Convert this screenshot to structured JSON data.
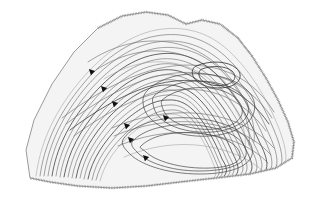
{
  "figure": {
    "domain": "map",
    "kind": "structural-contour-map",
    "title": "",
    "width": 310,
    "height": 201,
    "background_color": "#ffffff",
    "interior_fill_color": "#f4f4f4",
    "contour_color": "#6d6d6d",
    "emphasis_contour_color": "#3c3c3c",
    "faint_contour_color": "#9a9a9a",
    "boundary_color": "#8e8e8e",
    "hatch_color": "#8a8a8a",
    "marker_color": "#111111"
  },
  "map_outline": {
    "name": "study-area-boundary",
    "style": "hachured",
    "path": "M 30 178 L 26 150 L 34 120 L 52 84 L 74 52 L 98 28 L 122 16 L 146 12 L 168 15 L 186 24 L 202 20 L 220 24 L 238 38 L 252 56 L 266 78 L 278 100 L 288 122 L 294 142 L 292 158 L 276 168 L 250 174 L 216 178 L 180 182 L 146 186 L 112 188 L 78 186 L 50 182 Z"
  },
  "hachure_segments": [
    {
      "name": "hachure-top",
      "path": "M 98 28 L 122 16 L 146 12 L 168 15 L 186 24"
    },
    {
      "name": "hachure-top-right",
      "path": "M 186 24 L 202 20 L 220 24 L 238 38 L 252 56"
    },
    {
      "name": "hachure-right",
      "path": "M 252 56 L 266 78 L 278 100 L 288 122 L 294 142"
    },
    {
      "name": "hachure-right-lower",
      "path": "M 294 142 L 292 158 L 276 168 L 250 174"
    },
    {
      "name": "hachure-bottom",
      "path": "M 250 174 L 216 178 L 180 182 L 146 186 L 112 188 L 78 186"
    },
    {
      "name": "hachure-bottom-left",
      "path": "M 78 186 L 50 182 L 30 178"
    }
  ],
  "contours": [
    {
      "name": "contour-outer-1",
      "emphasis": "faint",
      "path": "M 36 176 C 40 146 52 116 76 86 C 98 58 126 36 156 30 C 184 25 208 32 228 50 C 248 68 266 96 278 126 C 286 146 288 160 284 168"
    },
    {
      "name": "contour-outer-2",
      "emphasis": "normal",
      "path": "M 40 176 C 44 147 56 118 79 89 C 100 62 127 41 156 36 C 183 31 206 39 225 56 C 245 74 262 101 274 130 C 282 149 284 161 280 169"
    },
    {
      "name": "contour-outer-3",
      "emphasis": "normal",
      "path": "M 44 176 C 48 148 60 120 82 92 C 103 66 129 46 157 42 C 182 38 204 46 222 62 C 241 80 257 106 269 134 C 277 152 279 162 275 170"
    },
    {
      "name": "contour-4",
      "emphasis": "normal",
      "path": "M 48 176 C 52 149 64 122 86 95 C 106 70 131 52 158 48 C 182 45 202 53 219 68 C 237 86 252 110 264 138 C 272 155 274 164 270 171"
    },
    {
      "name": "contour-5",
      "emphasis": "dark",
      "path": "M 52 176 C 56 150 68 124 90 98 C 110 74 134 57 159 54 C 181 51 200 59 216 74 C 233 91 247 115 259 141 C 267 157 269 165 265 172"
    },
    {
      "name": "contour-6",
      "emphasis": "normal",
      "path": "M 56 176 C 60 151 72 126 93 101 C 113 78 136 62 160 59 C 181 57 198 65 213 79 C 229 96 243 118 254 144 C 262 159 264 166 260 172"
    },
    {
      "name": "contour-7",
      "emphasis": "normal",
      "path": "M 60 177 C 64 152 76 128 97 104 C 116 82 138 67 161 64 C 180 62 196 70 210 84 C 226 100 239 121 250 146 C 257 160 259 167 255 173"
    },
    {
      "name": "contour-8",
      "emphasis": "dark",
      "path": "M 64 177 C 68 153 80 130 100 107 C 119 86 140 72 162 70 C 180 68 195 76 208 89 C 222 104 235 124 245 148 C 252 161 254 168 250 173"
    },
    {
      "name": "contour-9",
      "emphasis": "normal",
      "path": "M 68 177 C 72 154 84 132 104 110 C 122 90 142 77 163 75 C 180 73 194 81 206 93 C 219 107 231 127 241 150 C 247 162 249 168 245 174"
    },
    {
      "name": "contour-10",
      "emphasis": "normal",
      "path": "M 72 178 C 76 155 88 134 107 113 C 125 94 144 82 164 80 C 180 78 193 86 204 98 C 216 111 228 130 237 152 C 243 163 245 169 241 174"
    },
    {
      "name": "contour-11",
      "emphasis": "dark",
      "path": "M 76 178 C 80 156 92 136 110 116 C 128 98 146 86 165 85 C 180 84 192 91 202 102 C 213 114 224 133 233 154 C 238 164 240 170 236 175"
    },
    {
      "name": "contour-12",
      "emphasis": "normal",
      "path": "M 80 178 C 84 157 96 138 113 119 C 131 102 148 91 166 90 C 180 89 191 96 200 106 C 210 118 221 136 229 156 C 234 165 236 170 232 175"
    },
    {
      "name": "contour-13",
      "emphasis": "normal",
      "path": "M 84 179 C 88 158 100 140 117 122 C 134 106 150 96 167 95 C 180 94 190 100 198 110 C 208 121 218 139 226 158 C 230 166 232 171 228 176"
    },
    {
      "name": "contour-14",
      "emphasis": "dark",
      "path": "M 88 179 C 92 159 104 142 120 125 C 137 110 152 100 168 100 C 180 99 189 105 197 114 C 205 124 215 141 222 159 C 227 167 228 172 224 176"
    },
    {
      "name": "contour-15",
      "emphasis": "normal",
      "path": "M 92 180 C 96 160 108 144 124 128 C 140 114 155 105 169 105 C 180 104 188 110 195 118 C 203 127 212 143 219 161 C 223 168 224 173 220 177"
    },
    {
      "name": "contour-16",
      "emphasis": "normal",
      "path": "M 96 180 C 101 161 112 146 128 131 C 143 118 157 110 170 110 C 180 109 188 114 194 122 C 201 130 209 145 216 162 C 219 169 221 173 217 177"
    },
    {
      "name": "contour-17",
      "emphasis": "faint",
      "path": "M 100 181 C 105 162 116 148 131 134 C 146 122 159 114 171 114 C 180 114 187 119 193 126 C 199 133 207 147 213 163 C 216 170 217 174 214 178"
    },
    {
      "name": "contour-upper-a",
      "emphasis": "normal",
      "path": "M 62 118 C 86 100 112 84 140 74 C 168 64 196 62 222 70 C 244 77 262 92 274 112"
    },
    {
      "name": "contour-upper-b",
      "emphasis": "normal",
      "path": "M 66 124 C 90 106 116 90 144 80 C 170 71 196 70 220 77 C 242 84 260 99 272 118"
    },
    {
      "name": "contour-upper-c",
      "emphasis": "dark",
      "path": "M 70 130 C 94 112 120 96 147 87 C 172 79 197 78 219 85 C 240 92 257 106 269 124"
    },
    {
      "name": "contour-upper-d",
      "emphasis": "normal",
      "path": "M 74 136 C 98 118 124 103 150 95 C 174 88 197 87 218 94 C 238 101 254 114 266 131"
    },
    {
      "name": "contour-crest-1",
      "emphasis": "normal",
      "path": "M 88 62 C 112 46 140 38 168 42 C 196 46 220 62 236 86 C 250 106 256 126 254 142"
    },
    {
      "name": "contour-crest-2",
      "emphasis": "normal",
      "path": "M 96 70 C 119 55 145 48 170 52 C 196 56 218 71 233 93 C 246 112 251 130 249 145"
    },
    {
      "name": "contour-crest-3",
      "emphasis": "faint",
      "path": "M 104 79 C 126 65 150 59 173 63 C 196 67 216 81 230 101 C 242 118 247 134 245 148"
    },
    {
      "name": "contour-sweep-1",
      "emphasis": "normal",
      "path": "M 112 128 C 140 116 172 110 204 114 C 234 118 258 130 274 148"
    },
    {
      "name": "contour-sweep-2",
      "emphasis": "normal",
      "path": "M 114 136 C 142 124 174 119 204 123 C 233 127 256 138 271 155"
    },
    {
      "name": "contour-sweep-3",
      "emphasis": "normal",
      "path": "M 118 146 C 146 134 176 130 205 134 C 232 138 254 148 268 163"
    },
    {
      "name": "contour-sweep-4",
      "emphasis": "faint",
      "path": "M 124 157 C 150 146 178 142 205 146 C 230 150 250 159 263 171"
    }
  ],
  "closures": [
    {
      "name": "closure-upper-ring-1",
      "emphasis": "normal",
      "path": "M 146 92 C 160 76 190 70 218 76 C 244 82 258 96 254 112 C 250 128 224 138 196 136 C 168 134 148 122 144 108 C 142 100 143 96 146 92 Z"
    },
    {
      "name": "closure-upper-ring-2",
      "emphasis": "normal",
      "path": "M 154 96 C 168 83 194 78 217 83 C 239 88 251 100 248 113 C 245 126 222 134 198 132 C 174 130 157 120 154 108 C 152 101 152 98 154 96 Z"
    },
    {
      "name": "closure-upper-ring-3",
      "emphasis": "normal",
      "path": "M 162 100 C 175 89 197 85 216 89 C 234 93 244 103 242 114 C 239 125 220 131 200 129 C 180 127 166 119 163 109 C 161 104 161 102 162 100 Z"
    },
    {
      "name": "closure-upper-crest-1",
      "emphasis": "tight",
      "path": "M 196 66 C 210 60 228 61 236 68 C 244 75 240 84 228 87 C 214 90 199 86 194 78 C 191 73 192 68 196 66 Z"
    },
    {
      "name": "closure-upper-crest-2",
      "emphasis": "tight",
      "path": "M 202 69 C 212 65 226 66 232 71 C 238 77 234 83 225 85 C 214 87 203 84 200 78 C 198 74 199 70 202 69 Z"
    },
    {
      "name": "closure-lower-ring-1",
      "emphasis": "normal",
      "path": "M 124 138 C 134 124 160 116 192 118 C 224 120 248 132 252 148 C 256 164 234 174 200 174 C 166 174 138 164 128 152 C 122 146 121 142 124 138 Z"
    },
    {
      "name": "closure-lower-ring-2",
      "emphasis": "normal",
      "path": "M 132 142 C 142 130 166 123 194 125 C 222 127 243 137 246 150 C 249 164 228 171 199 171 C 170 171 146 162 137 152 C 132 147 131 145 132 142 Z"
    },
    {
      "name": "closure-lower-ring-3",
      "emphasis": "normal",
      "path": "M 140 147 C 150 136 171 131 196 133 C 220 135 238 143 240 154 C 242 164 224 169 199 168 C 175 167 154 160 146 152 C 141 148 140 148 140 147 Z"
    }
  ],
  "axis_markers": [
    {
      "name": "fold-axis-marker-1",
      "x": 92,
      "y": 72
    },
    {
      "name": "fold-axis-marker-2",
      "x": 104,
      "y": 89
    },
    {
      "name": "fold-axis-marker-3",
      "x": 115,
      "y": 104
    },
    {
      "name": "fold-axis-marker-4",
      "x": 127,
      "y": 126
    },
    {
      "name": "fold-axis-marker-5",
      "x": 131,
      "y": 140
    },
    {
      "name": "fold-axis-marker-6",
      "x": 146,
      "y": 158
    },
    {
      "name": "fold-axis-marker-7",
      "x": 166,
      "y": 118
    }
  ]
}
